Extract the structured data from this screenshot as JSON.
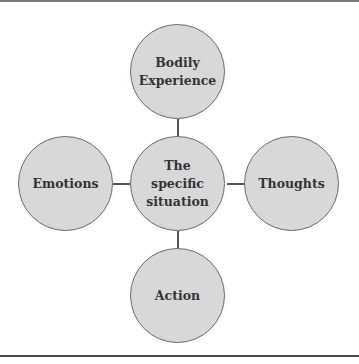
{
  "diagram": {
    "type": "hub-and-spoke",
    "center": {
      "lines": [
        "The",
        "specific",
        "situation"
      ]
    },
    "nodes": {
      "top": {
        "lines": [
          "Bodily",
          "Experience"
        ]
      },
      "left": {
        "lines": [
          "Emotions"
        ]
      },
      "right": {
        "lines": [
          "Thoughts"
        ]
      },
      "bottom": {
        "lines": [
          "Action"
        ]
      }
    },
    "colors": {
      "node_fill": "#d8d8d8",
      "node_border": "#6a6a6a",
      "text": "#333333",
      "connector": "#555555"
    }
  }
}
